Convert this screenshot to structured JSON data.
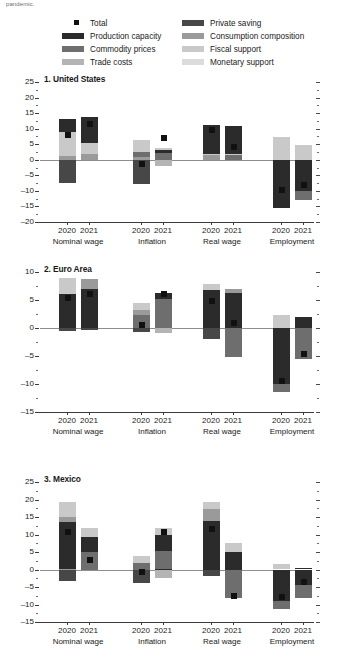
{
  "header": {
    "truncated_text": "pandemic."
  },
  "legend": {
    "column1": [
      {
        "label": "Total",
        "color": "#111111",
        "swatch": "square-marker"
      },
      {
        "label": "Production capacity",
        "color": "#2b2b2b",
        "swatch": "bar"
      },
      {
        "label": "Commodity prices",
        "color": "#6e6e6e",
        "swatch": "bar"
      },
      {
        "label": "Trade costs",
        "color": "#b4b4b4",
        "swatch": "bar"
      }
    ],
    "column2": [
      {
        "label": "Private saving",
        "color": "#474747",
        "swatch": "bar"
      },
      {
        "label": "Consumption composition",
        "color": "#9a9a9a",
        "swatch": "bar"
      },
      {
        "label": "Fiscal support",
        "color": "#c9c9c9",
        "swatch": "bar"
      },
      {
        "label": "Monetary support",
        "color": "#dcdcdc",
        "swatch": "bar"
      }
    ]
  },
  "chart_data": {
    "type": "bar",
    "subtype": "stacked-bar-with-total-marker",
    "grid": false,
    "legend_position": "top",
    "series_colors": {
      "Production capacity": "#2b2b2b",
      "Commodity prices": "#6e6e6e",
      "Trade costs": "#b4b4b4",
      "Private saving": "#474747",
      "Consumption composition": "#9a9a9a",
      "Fiscal support": "#c9c9c9",
      "Monetary support": "#dcdcdc",
      "Total": "#111111"
    },
    "series_names": [
      "Production capacity",
      "Private saving",
      "Commodity prices",
      "Consumption composition",
      "Trade costs",
      "Fiscal support",
      "Monetary support"
    ],
    "groups": [
      "Nominal wage",
      "Inflation",
      "Real wage",
      "Employment"
    ],
    "years": [
      "2020",
      "2021"
    ],
    "panels": [
      {
        "index": "1",
        "name": "1. United States",
        "ylim": [
          -20,
          25
        ],
        "yticks": [
          -20,
          -15,
          -10,
          -5,
          0,
          5,
          10,
          15,
          20,
          25
        ],
        "ytick_labels": [
          "–20",
          "–15",
          "–10",
          "–5",
          "0",
          "5",
          "10",
          "15",
          "20",
          "25"
        ],
        "bars": [
          {
            "group": "Nominal wage",
            "year": "2020",
            "total": 8.0,
            "positive": [
              {
                "s": "Production capacity",
                "v": 13.0
              },
              {
                "s": "Consumption composition",
                "v": 1.2
              },
              {
                "s": "Fiscal support",
                "v": 8.8
              }
            ],
            "negative": [
              {
                "s": "Private saving",
                "v": -7.5
              }
            ]
          },
          {
            "group": "Nominal wage",
            "year": "2021",
            "total": 11.5,
            "positive": [
              {
                "s": "Production capacity",
                "v": 13.8
              },
              {
                "s": "Consumption composition",
                "v": 2.0
              },
              {
                "s": "Fiscal support",
                "v": 5.4
              }
            ],
            "negative": []
          },
          {
            "group": "Inflation",
            "year": "2020",
            "total": -1.5,
            "positive": [
              {
                "s": "Commodity prices",
                "v": 2.6
              },
              {
                "s": "Consumption composition",
                "v": 0.8
              },
              {
                "s": "Fiscal support",
                "v": 6.3
              }
            ],
            "negative": [
              {
                "s": "Private saving",
                "v": -7.8
              }
            ]
          },
          {
            "group": "Inflation",
            "year": "2021",
            "total": 7.0,
            "positive": [
              {
                "s": "Production capacity",
                "v": 3.0
              },
              {
                "s": "Commodity prices",
                "v": 2.2
              },
              {
                "s": "Fiscal support",
                "v": 3.8
              }
            ],
            "negative": [
              {
                "s": "Trade costs",
                "v": -2.0
              }
            ]
          },
          {
            "group": "Real wage",
            "year": "2020",
            "total": 9.7,
            "positive": [
              {
                "s": "Production capacity",
                "v": 11.2
              },
              {
                "s": "Consumption composition",
                "v": 1.4
              },
              {
                "s": "Fiscal support",
                "v": 2.0
              }
            ],
            "negative": []
          },
          {
            "group": "Real wage",
            "year": "2021",
            "total": 4.0,
            "positive": [
              {
                "s": "Production capacity",
                "v": 10.8
              },
              {
                "s": "Commodity prices",
                "v": 1.4
              },
              {
                "s": "Fiscal support",
                "v": 1.7
              }
            ],
            "negative": []
          },
          {
            "group": "Employment",
            "year": "2020",
            "total": -9.8,
            "positive": [
              {
                "s": "Fiscal support",
                "v": 7.2
              }
            ],
            "negative": [
              {
                "s": "Production capacity",
                "v": -15.5
              }
            ]
          },
          {
            "group": "Employment",
            "year": "2021",
            "total": -8.2,
            "positive": [
              {
                "s": "Fiscal support",
                "v": 4.8
              }
            ],
            "negative": [
              {
                "s": "Production capacity",
                "v": -10.0
              },
              {
                "s": "Commodity prices",
                "v": -13.0
              }
            ]
          }
        ]
      },
      {
        "index": "2",
        "name": "2. Euro Area",
        "ylim": [
          -15,
          10
        ],
        "yticks": [
          -15,
          -10,
          -5,
          0,
          5,
          10
        ],
        "ytick_labels": [
          "–15",
          "–10",
          "–5",
          "0",
          "5",
          "10"
        ],
        "bars": [
          {
            "group": "Nominal wage",
            "year": "2020",
            "total": 5.3,
            "positive": [
              {
                "s": "Production capacity",
                "v": 6.0
              },
              {
                "s": "Fiscal support",
                "v": 9.0
              }
            ],
            "negative": [
              {
                "s": "Private saving",
                "v": -0.6
              }
            ]
          },
          {
            "group": "Nominal wage",
            "year": "2021",
            "total": 6.1,
            "positive": [
              {
                "s": "Production capacity",
                "v": 7.0
              },
              {
                "s": "Consumption composition",
                "v": 8.8
              }
            ],
            "negative": [
              {
                "s": "Private saving",
                "v": -0.4
              }
            ]
          },
          {
            "group": "Inflation",
            "year": "2020",
            "total": 0.6,
            "positive": [
              {
                "s": "Commodity prices",
                "v": 2.3
              },
              {
                "s": "Consumption composition",
                "v": 3.2
              },
              {
                "s": "Fiscal support",
                "v": 4.5
              }
            ],
            "negative": [
              {
                "s": "Private saving",
                "v": -0.8
              }
            ]
          },
          {
            "group": "Inflation",
            "year": "2021",
            "total": 6.0,
            "positive": [
              {
                "s": "Commodity prices",
                "v": 5.2
              },
              {
                "s": "Production capacity",
                "v": 6.2
              }
            ],
            "negative": [
              {
                "s": "Trade costs",
                "v": -0.9
              }
            ]
          },
          {
            "group": "Real wage",
            "year": "2020",
            "total": 4.9,
            "positive": [
              {
                "s": "Production capacity",
                "v": 6.8
              },
              {
                "s": "Fiscal support",
                "v": 7.8
              }
            ],
            "negative": [
              {
                "s": "Private saving",
                "v": -2.0
              }
            ]
          },
          {
            "group": "Real wage",
            "year": "2021",
            "total": 0.9,
            "positive": [
              {
                "s": "Production capacity",
                "v": 6.2
              },
              {
                "s": "Consumption composition",
                "v": 6.9
              }
            ],
            "negative": [
              {
                "s": "Commodity prices",
                "v": -5.1
              }
            ]
          },
          {
            "group": "Employment",
            "year": "2020",
            "total": -9.5,
            "positive": [
              {
                "s": "Fiscal support",
                "v": 2.4
              }
            ],
            "negative": [
              {
                "s": "Production capacity",
                "v": -10.0
              },
              {
                "s": "Commodity prices",
                "v": -11.4
              }
            ]
          },
          {
            "group": "Employment",
            "year": "2021",
            "total": -4.6,
            "positive": [
              {
                "s": "Production capacity",
                "v": 2.0
              }
            ],
            "negative": [
              {
                "s": "Commodity prices",
                "v": -5.5
              }
            ]
          }
        ]
      },
      {
        "index": "3",
        "name": "3. Mexico",
        "ylim": [
          -15,
          25
        ],
        "yticks": [
          -15,
          -10,
          -5,
          0,
          5,
          10,
          15,
          20,
          25
        ],
        "ytick_labels": [
          "–15",
          "–10",
          "–5",
          "0",
          "5",
          "10",
          "15",
          "20",
          "25"
        ],
        "bars": [
          {
            "group": "Nominal wage",
            "year": "2020",
            "total": 10.6,
            "positive": [
              {
                "s": "Production capacity",
                "v": 13.6
              },
              {
                "s": "Consumption composition",
                "v": 15.0
              },
              {
                "s": "Fiscal support",
                "v": 19.4
              }
            ],
            "negative": [
              {
                "s": "Private saving",
                "v": -3.4
              }
            ]
          },
          {
            "group": "Nominal wage",
            "year": "2021",
            "total": 2.6,
            "positive": [
              {
                "s": "Commodity prices",
                "v": 5.0
              },
              {
                "s": "Production capacity",
                "v": 9.2
              },
              {
                "s": "Fiscal support",
                "v": 12.0
              }
            ],
            "negative": []
          },
          {
            "group": "Inflation",
            "year": "2020",
            "total": -0.6,
            "positive": [
              {
                "s": "Commodity prices",
                "v": 2.0
              },
              {
                "s": "Fiscal support",
                "v": 4.0
              }
            ],
            "negative": [
              {
                "s": "Private saving",
                "v": -3.9
              }
            ]
          },
          {
            "group": "Inflation",
            "year": "2021",
            "total": 10.6,
            "positive": [
              {
                "s": "Commodity prices",
                "v": 5.4
              },
              {
                "s": "Production capacity",
                "v": 10.0
              },
              {
                "s": "Fiscal support",
                "v": 11.9
              }
            ],
            "negative": [
              {
                "s": "Trade costs",
                "v": -2.5
              }
            ]
          },
          {
            "group": "Real wage",
            "year": "2020",
            "total": 11.5,
            "positive": [
              {
                "s": "Production capacity",
                "v": 14.0
              },
              {
                "s": "Consumption composition",
                "v": 17.2
              },
              {
                "s": "Fiscal support",
                "v": 19.2
              }
            ],
            "negative": [
              {
                "s": "Private saving",
                "v": -1.8
              }
            ]
          },
          {
            "group": "Real wage",
            "year": "2021",
            "total": -7.6,
            "positive": [
              {
                "s": "Production capacity",
                "v": 5.0
              },
              {
                "s": "Fiscal support",
                "v": 7.6
              }
            ],
            "negative": [
              {
                "s": "Commodity prices",
                "v": -8.0
              }
            ]
          },
          {
            "group": "Employment",
            "year": "2020",
            "total": -7.9,
            "positive": [
              {
                "s": "Fiscal support",
                "v": 1.6
              }
            ],
            "negative": [
              {
                "s": "Production capacity",
                "v": -9.0
              },
              {
                "s": "Commodity prices",
                "v": -11.2
              }
            ]
          },
          {
            "group": "Employment",
            "year": "2021",
            "total": -3.6,
            "positive": [
              {
                "s": "Production capacity",
                "v": 0.4
              }
            ],
            "negative": [
              {
                "s": "Production capacity",
                "v": -4.5
              },
              {
                "s": "Commodity prices",
                "v": -8.2
              }
            ]
          }
        ]
      }
    ]
  }
}
